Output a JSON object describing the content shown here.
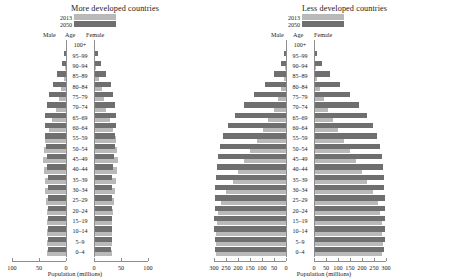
{
  "figure": {
    "axis_title": "Population (millions)",
    "legend": [
      {
        "label": "2013",
        "color": "#b9b9b9"
      },
      {
        "label": "2050",
        "color": "#6f6f6f"
      }
    ],
    "column_headers": {
      "male": "Male",
      "age": "Age",
      "female": "Female"
    },
    "age_groups": [
      "100+",
      "95–99",
      "90–94",
      "85–89",
      "80–84",
      "75–79",
      "70–74",
      "65–69",
      "60–64",
      "55–59",
      "50–54",
      "45–49",
      "40–44",
      "35–39",
      "30–34",
      "25–29",
      "20–24",
      "15–19",
      "10–14",
      "5–9",
      "0–4"
    ]
  },
  "chart_data": [
    {
      "type": "bar",
      "title": "More developed countries",
      "subtype": "population-pyramid",
      "xlabel": "Population (millions)",
      "ylabel": "Age",
      "categories": [
        "100+",
        "95–99",
        "90–94",
        "85–89",
        "80–84",
        "75–79",
        "70–74",
        "65–69",
        "60–64",
        "55–59",
        "50–54",
        "45–49",
        "40–44",
        "35–39",
        "30–34",
        "25–29",
        "20–24",
        "15–19",
        "10–14",
        "5–9",
        "0–4"
      ],
      "xlim": [
        -100,
        100
      ],
      "xticks_left": [
        100,
        50,
        0
      ],
      "xticks_right": [
        0,
        50,
        100
      ],
      "grid": false,
      "legend_position": "top-left",
      "series": [
        {
          "name": "2013 Male",
          "color": "#b9b9b9",
          "side": "left",
          "values": [
            0.1,
            0.6,
            1.8,
            4.5,
            8.5,
            13.5,
            18.5,
            26.0,
            32.0,
            38.0,
            40.0,
            43.0,
            41.0,
            39.0,
            38.0,
            37.0,
            36.0,
            35.0,
            35.0,
            36.0,
            36.0
          ]
        },
        {
          "name": "2050 Male",
          "color": "#6f6f6f",
          "side": "left",
          "values": [
            0.8,
            3.0,
            8.0,
            16.0,
            25.0,
            31.0,
            36.0,
            38.0,
            38.0,
            38.0,
            37.0,
            36.0,
            35.0,
            34.0,
            34.0,
            34.0,
            34.0,
            34.0,
            34.0,
            34.0,
            34.0
          ]
        },
        {
          "name": "2013 Female",
          "color": "#b9b9b9",
          "side": "right",
          "values": [
            0.4,
            1.8,
            4.6,
            9.0,
            14.0,
            19.0,
            23.0,
            30.0,
            35.0,
            41.0,
            43.0,
            45.0,
            42.0,
            40.0,
            39.0,
            37.0,
            35.0,
            34.0,
            33.0,
            34.0,
            34.0
          ]
        },
        {
          "name": "2050 Female",
          "color": "#6f6f6f",
          "side": "right",
          "values": [
            2.2,
            6.5,
            13.0,
            22.0,
            31.0,
            36.0,
            39.0,
            40.0,
            40.0,
            39.0,
            38.0,
            37.0,
            35.0,
            34.0,
            34.0,
            33.0,
            33.0,
            33.0,
            33.0,
            33.0,
            32.0
          ]
        }
      ]
    },
    {
      "type": "bar",
      "title": "Less developed countries",
      "subtype": "population-pyramid",
      "xlabel": "Population (millions)",
      "ylabel": "Age",
      "categories": [
        "100+",
        "95–99",
        "90–94",
        "85–89",
        "80–84",
        "75–79",
        "70–74",
        "65–69",
        "60–64",
        "55–59",
        "50–54",
        "45–49",
        "40–44",
        "35–39",
        "30–34",
        "25–29",
        "20–24",
        "15–19",
        "10–14",
        "5–9",
        "0–4"
      ],
      "xlim": [
        -300,
        300
      ],
      "xticks_left": [
        300,
        250,
        200,
        150,
        100,
        50,
        0
      ],
      "xticks_right": [
        0,
        50,
        100,
        150,
        200,
        250,
        300
      ],
      "grid": false,
      "legend_position": "top-left",
      "series": [
        {
          "name": "2013 Male",
          "color": "#b9b9b9",
          "side": "left",
          "values": [
            0.2,
            1.0,
            3.5,
            9.0,
            19.0,
            33.0,
            51.0,
            73.0,
            95.0,
            120.0,
            148.0,
            173.0,
            198.0,
            222.0,
            248.0,
            270.0,
            282.0,
            288.0,
            291.0,
            293.0,
            292.0
          ]
        },
        {
          "name": "2050 Male",
          "color": "#6f6f6f",
          "side": "left",
          "values": [
            1.5,
            7.0,
            21.0,
            48.0,
            88.0,
            132.0,
            175.0,
            212.0,
            242.0,
            262.0,
            275.0,
            284.0,
            289.0,
            292.0,
            294.0,
            296.0,
            297.0,
            298.0,
            298.0,
            297.0,
            295.0
          ]
        },
        {
          "name": "2013 Female",
          "color": "#b9b9b9",
          "side": "right",
          "values": [
            0.5,
            2.2,
            6.5,
            14.0,
            26.0,
            42.0,
            60.0,
            81.0,
            102.0,
            126.0,
            152.0,
            176.0,
            199.0,
            222.0,
            246.0,
            266.0,
            277.0,
            282.0,
            284.0,
            286.0,
            285.0
          ]
        },
        {
          "name": "2050 Female",
          "color": "#6f6f6f",
          "side": "right",
          "values": [
            3.5,
            13.0,
            33.0,
            66.0,
            108.0,
            150.0,
            188.0,
            220.0,
            246.0,
            264.0,
            276.0,
            283.0,
            288.0,
            290.0,
            292.0,
            294.0,
            295.0,
            295.0,
            295.0,
            294.0,
            292.0
          ]
        }
      ]
    }
  ]
}
